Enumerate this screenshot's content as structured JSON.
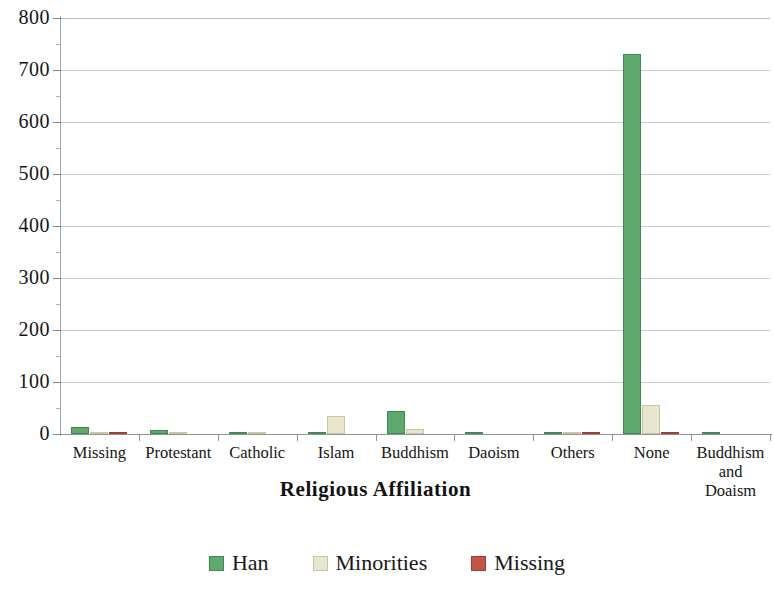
{
  "chart_data": {
    "type": "bar",
    "title": "",
    "xlabel": "Religious Affiliation",
    "ylabel": "",
    "ylim": [
      0,
      800
    ],
    "yticks": [
      0,
      100,
      200,
      300,
      400,
      500,
      600,
      700,
      800
    ],
    "grid": true,
    "legend_position": "bottom",
    "categories": [
      "Missing",
      "Protestant",
      "Catholic",
      "Islam",
      "Buddhism",
      "Daoism",
      "Others",
      "None",
      "Buddhism and Doaism"
    ],
    "category_lines": [
      [
        "Missing"
      ],
      [
        "Protestant"
      ],
      [
        "Catholic"
      ],
      [
        "Islam"
      ],
      [
        "Buddhism"
      ],
      [
        "Daoism"
      ],
      [
        "Others"
      ],
      [
        "None"
      ],
      [
        "Buddhism",
        "and",
        "Doaism"
      ]
    ],
    "series": [
      {
        "name": "Han",
        "color": "#5fa96f",
        "values": [
          13,
          8,
          3,
          2,
          45,
          3,
          4,
          730,
          3
        ]
      },
      {
        "name": "Minorities",
        "color": "#e8e6cf",
        "values": [
          1,
          1,
          1,
          35,
          10,
          0,
          1,
          55,
          0
        ]
      },
      {
        "name": "Missing",
        "color": "#c0554a",
        "values": [
          1,
          0,
          0,
          0,
          0,
          0,
          1,
          4,
          0
        ]
      }
    ]
  },
  "legend": {
    "items": [
      {
        "label": "Han",
        "key": "han"
      },
      {
        "label": "Minorities",
        "key": "min"
      },
      {
        "label": "Missing",
        "key": "mis"
      }
    ]
  }
}
